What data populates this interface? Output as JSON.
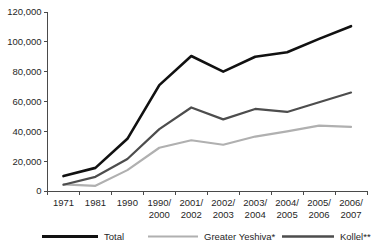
{
  "chart_data": {
    "type": "line",
    "title": "",
    "xlabel": "",
    "ylabel": "",
    "grid": false,
    "legend_position": "bottom",
    "ylim": [
      0,
      120000
    ],
    "ytick_labels": [
      "120,000",
      "100,000",
      "80,000",
      "60,000",
      "40,000",
      "20,000",
      "0"
    ],
    "ytick_values": [
      120000,
      100000,
      80000,
      60000,
      40000,
      20000,
      0
    ],
    "categories": [
      "1971",
      "1981",
      "1990",
      "1990/ 2000",
      "2001/ 2002",
      "2002/ 2003",
      "2003/ 2004",
      "2004/ 2005",
      "2005/ 2006",
      "2006/ 2007"
    ],
    "category_lines": [
      [
        "1971",
        ""
      ],
      [
        "1981",
        ""
      ],
      [
        "1990",
        ""
      ],
      [
        "1990/",
        "2000"
      ],
      [
        "2001/",
        "2002"
      ],
      [
        "2002/",
        "2003"
      ],
      [
        "2003/",
        "2004"
      ],
      [
        "2004/",
        "2005"
      ],
      [
        "2005/",
        "2006"
      ],
      [
        "2006/",
        "2007"
      ]
    ],
    "series": [
      {
        "name": "Total",
        "color": "#111111",
        "width": 2.6,
        "values": [
          10000,
          15500,
          35000,
          71000,
          90500,
          80000,
          90000,
          93000,
          102000,
          110500
        ]
      },
      {
        "name": "Greater Yeshiva*",
        "color": "#b0b0b0",
        "width": 2.2,
        "values": [
          4500,
          3500,
          14000,
          29000,
          34000,
          31000,
          36500,
          40000,
          43800,
          43000
        ]
      },
      {
        "name": "Kollel**",
        "color": "#4d4d4d",
        "width": 2.2,
        "values": [
          4200,
          9500,
          21500,
          41500,
          56000,
          48000,
          55000,
          53000,
          59500,
          66000
        ]
      }
    ]
  },
  "legend": {
    "items": [
      {
        "label": "Total",
        "color": "#111111",
        "width": 3.0
      },
      {
        "label": "Greater Yeshiva*",
        "color": "#b0b0b0",
        "width": 2.2
      },
      {
        "label": "Kollel**",
        "color": "#4d4d4d",
        "width": 2.6
      }
    ]
  }
}
